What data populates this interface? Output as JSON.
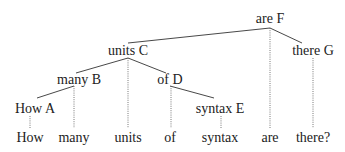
{
  "diagram": {
    "type": "dependency-tree",
    "nodes": [
      {
        "id": "F",
        "label": "are F",
        "x": 270,
        "y": 19
      },
      {
        "id": "C",
        "label": "units C",
        "x": 128,
        "y": 51
      },
      {
        "id": "G",
        "label": "there G",
        "x": 313,
        "y": 51
      },
      {
        "id": "B",
        "label": "many B",
        "x": 79,
        "y": 80
      },
      {
        "id": "D",
        "label": "of D",
        "x": 170,
        "y": 80
      },
      {
        "id": "A",
        "label": "How A",
        "x": 35,
        "y": 109
      },
      {
        "id": "E",
        "label": "syntax E",
        "x": 220,
        "y": 109
      }
    ],
    "words": [
      {
        "label": "How",
        "x": 30,
        "y": 138
      },
      {
        "label": "many",
        "x": 74,
        "y": 138
      },
      {
        "label": "units",
        "x": 128,
        "y": 138
      },
      {
        "label": "of",
        "x": 170,
        "y": 138
      },
      {
        "label": "syntax",
        "x": 220,
        "y": 138
      },
      {
        "label": "are",
        "x": 270,
        "y": 138
      },
      {
        "label": "there?",
        "x": 313,
        "y": 138
      }
    ],
    "edges": [
      {
        "from": "F",
        "to": "C",
        "x1": 270,
        "y1": 28,
        "x2": 128,
        "y2": 43
      },
      {
        "from": "F",
        "to": "G",
        "x1": 270,
        "y1": 28,
        "x2": 302,
        "y2": 43
      },
      {
        "from": "C",
        "to": "B",
        "x1": 128,
        "y1": 58,
        "x2": 76,
        "y2": 73
      },
      {
        "from": "C",
        "to": "D",
        "x1": 128,
        "y1": 58,
        "x2": 166,
        "y2": 73
      },
      {
        "from": "B",
        "to": "A",
        "x1": 74,
        "y1": 86,
        "x2": 37,
        "y2": 98
      },
      {
        "from": "D",
        "to": "E",
        "x1": 170,
        "y1": 86,
        "x2": 214,
        "y2": 98
      }
    ],
    "projections": [
      {
        "node": "A",
        "x": 30,
        "y1": 116,
        "y2": 128
      },
      {
        "node": "B",
        "x": 74,
        "y1": 86,
        "y2": 128
      },
      {
        "node": "C",
        "x": 128,
        "y1": 58,
        "y2": 128
      },
      {
        "node": "D",
        "x": 171,
        "y1": 86,
        "y2": 128
      },
      {
        "node": "E",
        "x": 221,
        "y1": 116,
        "y2": 128
      },
      {
        "node": "F",
        "x": 270,
        "y1": 28,
        "y2": 128
      },
      {
        "node": "G",
        "x": 313,
        "y1": 58,
        "y2": 128
      }
    ]
  }
}
